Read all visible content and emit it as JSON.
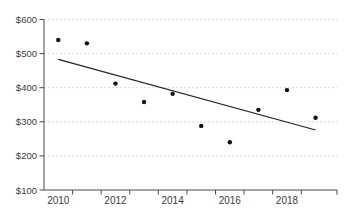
{
  "chart_data": {
    "type": "scatter",
    "title": "",
    "xlabel": "",
    "ylabel": "",
    "x": [
      2010,
      2011,
      2012,
      2013,
      2014,
      2015,
      2016,
      2017,
      2018,
      2019
    ],
    "series": [
      {
        "name": "observed-values",
        "values": [
          540,
          530,
          412,
          358,
          382,
          288,
          240,
          335,
          393,
          312
        ]
      }
    ],
    "trend_line": {
      "x1": 2010,
      "y1": 483,
      "x2": 2019,
      "y2": 276
    },
    "xlim": [
      2009.5,
      2019.75
    ],
    "ylim": [
      100,
      600
    ],
    "y_ticks": [
      100,
      200,
      300,
      400,
      500,
      600
    ],
    "y_tick_labels": [
      "$100",
      "$200",
      "$300",
      "$400",
      "$500",
      "$600"
    ],
    "x_tick_label_years": [
      2010,
      2012,
      2014,
      2016,
      2018
    ],
    "x_tick_labels": [
      "2010",
      "2012",
      "2014",
      "2016",
      "2018"
    ],
    "x_minor_ticks": [
      2010.5,
      2011.5,
      2012.5,
      2013.5,
      2014.5,
      2015.5,
      2016.5,
      2017.5,
      2018.5
    ],
    "grid": "horizontal-dashed",
    "legend": "none",
    "colors": {
      "point": "#111111",
      "trend": "#222222",
      "axis": "#4a4a4a",
      "grid": "#d9d9d9",
      "label": "#3b3b3b",
      "background": "#ffffff"
    }
  }
}
